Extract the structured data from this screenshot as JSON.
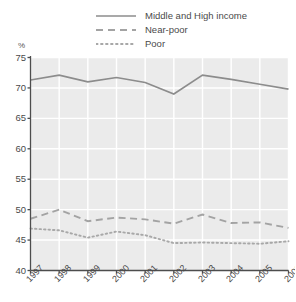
{
  "chart_data": {
    "type": "line",
    "title": "",
    "subtitle": "",
    "xlabel": "",
    "ylabel": "%",
    "categories": [
      "1997",
      "1998",
      "1999",
      "2000",
      "2001",
      "2002",
      "2003",
      "2004",
      "2005",
      "2006"
    ],
    "ylim": [
      40,
      75
    ],
    "yticks": [
      40,
      45,
      50,
      55,
      60,
      65,
      70,
      75
    ],
    "ytick_labels": [
      "40",
      "45",
      "50",
      "55",
      "60",
      "65",
      "70",
      "75"
    ],
    "grid": true,
    "legend_position": "top",
    "series": [
      {
        "name": "Middle and High income",
        "style": "solid",
        "color": "#8c8c8c",
        "values": [
          71.3,
          72.1,
          71.0,
          71.7,
          70.9,
          69.0,
          72.1,
          71.4,
          70.6,
          69.8
        ]
      },
      {
        "name": "Near-poor",
        "style": "dashed",
        "color": "#a3a3a3",
        "values": [
          48.5,
          50.0,
          48.1,
          48.7,
          48.4,
          47.7,
          49.2,
          47.8,
          47.9,
          47.0
        ]
      },
      {
        "name": "Poor",
        "style": "dotted",
        "color": "#a8a8a8",
        "values": [
          46.9,
          46.6,
          45.4,
          46.4,
          45.8,
          44.5,
          44.6,
          44.5,
          44.4,
          44.8
        ]
      }
    ]
  },
  "legend": {
    "items": [
      {
        "label": "Middle and High income",
        "style": "solid"
      },
      {
        "label": "Near-poor",
        "style": "dashed"
      },
      {
        "label": "Poor",
        "style": "dotted"
      }
    ]
  },
  "axis": {
    "unit_label": "%"
  },
  "colors": {
    "plot_background": "#ebebeb",
    "gridline": "#ffffff",
    "axis_line": "#4d4d4d",
    "text": "#4a4a4a",
    "series_solid": "#8c8c8c",
    "series_dashed": "#a3a3a3",
    "series_dotted": "#a8a8a8"
  }
}
